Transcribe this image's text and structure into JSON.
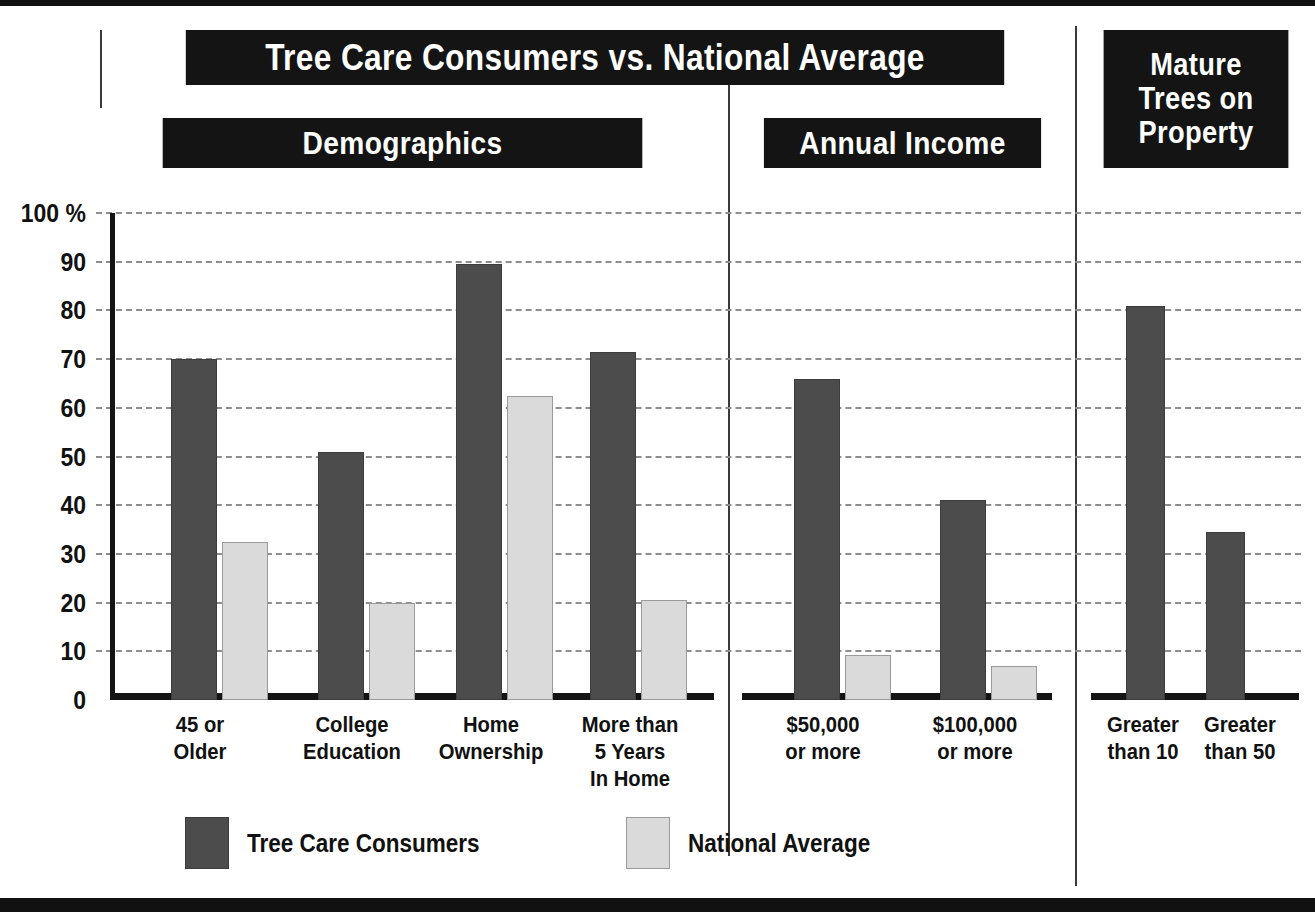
{
  "headers": {
    "title": "Tree Care Consumers vs. National Average",
    "demographics": "Demographics",
    "annual_income": "Annual Income",
    "mature_trees_line1": "Mature",
    "mature_trees_line2": "Trees on",
    "mature_trees_line3": "Property"
  },
  "legend": {
    "series1_label": "Tree Care Consumers",
    "series2_label": "National Average",
    "series1_color": "#4c4c4c",
    "series2_color": "#dadada"
  },
  "axis": {
    "ticks": [
      "100 %",
      "90",
      "80",
      "70",
      "60",
      "50",
      "40",
      "30",
      "20",
      "10",
      "0"
    ],
    "tick_values": [
      100,
      90,
      80,
      70,
      60,
      50,
      40,
      30,
      20,
      10,
      0
    ]
  },
  "chart_data": {
    "type": "bar",
    "title": "Tree Care Consumers vs. National Average",
    "xlabel": "",
    "ylabel": "",
    "ylim": [
      0,
      100
    ],
    "grid": true,
    "legend_position": "bottom-center",
    "panels": [
      {
        "name": "Demographics",
        "categories": [
          [
            "45 or",
            "Older"
          ],
          [
            "College",
            "Education"
          ],
          [
            "Home",
            "Ownership"
          ],
          [
            "More than",
            "5 Years",
            "In Home"
          ]
        ],
        "series": [
          {
            "name": "Tree Care Consumers",
            "values": [
              70,
              51,
              89.5,
              71.5
            ]
          },
          {
            "name": "National Average",
            "values": [
              32.5,
              20,
              62.5,
              20.5
            ]
          }
        ]
      },
      {
        "name": "Annual Income",
        "categories": [
          [
            "$50,000",
            "or more"
          ],
          [
            "$100,000",
            "or more"
          ]
        ],
        "series": [
          {
            "name": "Tree Care Consumers",
            "values": [
              66,
              41
            ]
          },
          {
            "name": "National Average",
            "values": [
              9.3,
              7
            ]
          }
        ]
      },
      {
        "name": "Mature Trees on Property",
        "categories": [
          [
            "Greater",
            "than 10"
          ],
          [
            "Greater",
            "than 50"
          ]
        ],
        "series": [
          {
            "name": "Tree Care Consumers",
            "values": [
              81,
              34.5
            ]
          }
        ]
      }
    ]
  },
  "layout": {
    "bars": [
      {
        "panel": 0,
        "group": 0,
        "series": 0,
        "x": 171,
        "w": 46,
        "value": 70
      },
      {
        "panel": 0,
        "group": 0,
        "series": 1,
        "x": 222,
        "w": 46,
        "value": 32.5
      },
      {
        "panel": 0,
        "group": 1,
        "series": 0,
        "x": 318,
        "w": 46,
        "value": 51
      },
      {
        "panel": 0,
        "group": 1,
        "series": 1,
        "x": 369,
        "w": 46,
        "value": 20
      },
      {
        "panel": 0,
        "group": 2,
        "series": 0,
        "x": 456,
        "w": 46,
        "value": 89.5
      },
      {
        "panel": 0,
        "group": 2,
        "series": 1,
        "x": 507,
        "w": 46,
        "value": 62.5
      },
      {
        "panel": 0,
        "group": 3,
        "series": 0,
        "x": 590,
        "w": 46,
        "value": 71.5
      },
      {
        "panel": 0,
        "group": 3,
        "series": 1,
        "x": 641,
        "w": 46,
        "value": 20.5
      },
      {
        "panel": 1,
        "group": 0,
        "series": 0,
        "x": 794,
        "w": 46,
        "value": 66
      },
      {
        "panel": 1,
        "group": 0,
        "series": 1,
        "x": 845,
        "w": 46,
        "value": 9.3
      },
      {
        "panel": 1,
        "group": 1,
        "series": 0,
        "x": 940,
        "w": 46,
        "value": 41
      },
      {
        "panel": 1,
        "group": 1,
        "series": 1,
        "x": 991,
        "w": 46,
        "value": 7
      },
      {
        "panel": 2,
        "group": 0,
        "series": 0,
        "x": 1126,
        "w": 39,
        "value": 81
      },
      {
        "panel": 2,
        "group": 1,
        "series": 0,
        "x": 1206,
        "w": 39,
        "value": 34.5
      }
    ],
    "catlabels": [
      {
        "x": 130,
        "w": 140,
        "lines": [
          "45 or",
          "Older"
        ]
      },
      {
        "x": 277,
        "w": 150,
        "lines": [
          "College",
          "Education"
        ]
      },
      {
        "x": 416,
        "w": 150,
        "lines": [
          "Home",
          "Ownership"
        ]
      },
      {
        "x": 545,
        "w": 170,
        "lines": [
          "More than",
          "5 Years",
          "In Home"
        ]
      },
      {
        "x": 748,
        "w": 150,
        "lines": [
          "$50,000",
          "or more"
        ]
      },
      {
        "x": 895,
        "w": 160,
        "lines": [
          "$100,000",
          "or more"
        ]
      },
      {
        "x": 1088,
        "w": 110,
        "lines": [
          "Greater",
          "than 10"
        ]
      },
      {
        "x": 1185,
        "w": 110,
        "lines": [
          "Greater",
          "than 50"
        ]
      }
    ]
  }
}
